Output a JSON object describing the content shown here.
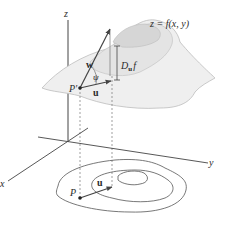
{
  "diagram": {
    "labels": {
      "z_axis": "z",
      "x_axis": "x",
      "y_axis": "y",
      "surface": "z = f(x, y)",
      "point_surface": "P′",
      "point_plane": "P",
      "vector_w": "w",
      "vector_u_surface": "u",
      "vector_u_plane": "u",
      "angle": "ψ",
      "derivative_D": "D",
      "derivative_sub": "u",
      "derivative_f": "f"
    },
    "colors": {
      "surface_fill": "#eeeeee",
      "surface_top": "#d9d9d9",
      "line": "#555555",
      "axis": "#444444",
      "text": "#2a2a2a"
    }
  }
}
